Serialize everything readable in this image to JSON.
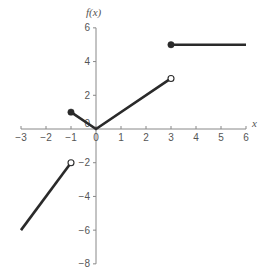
{
  "chart_data": {
    "type": "line",
    "title": "",
    "xlabel": "x",
    "ylabel": "f(x)",
    "xlim": [
      -3,
      6
    ],
    "ylim": [
      -8,
      6
    ],
    "grid": false,
    "x_ticks": [
      -3,
      -2,
      -1,
      0,
      1,
      2,
      3,
      4,
      5,
      6
    ],
    "x_tick_labels": [
      "−3",
      "−2",
      "−1",
      "0",
      "1",
      "2",
      "3",
      "4",
      "5",
      "6"
    ],
    "y_ticks": [
      -8,
      -6,
      -4,
      -2,
      0,
      2,
      4,
      6
    ],
    "y_tick_labels": [
      "−8",
      "−6",
      "−4",
      "−2",
      "0",
      "2",
      "4",
      "6"
    ],
    "series": [
      {
        "name": "piece-1",
        "x": [
          -3,
          -1
        ],
        "y": [
          -6,
          -2
        ],
        "endpoints": [
          {
            "x": -1,
            "y": -2,
            "style": "open"
          }
        ]
      },
      {
        "name": "piece-2",
        "x": [
          -1,
          0,
          3
        ],
        "y": [
          1,
          0,
          3
        ],
        "endpoints": [
          {
            "x": -1,
            "y": 1,
            "style": "closed"
          },
          {
            "x": 3,
            "y": 3,
            "style": "open"
          }
        ]
      },
      {
        "name": "piece-3",
        "x": [
          3,
          6
        ],
        "y": [
          5,
          5
        ],
        "endpoints": [
          {
            "x": 3,
            "y": 5,
            "style": "closed"
          }
        ]
      }
    ]
  },
  "labels": {
    "x_axis_title": "x",
    "y_axis_title": "f(x)"
  },
  "colors": {
    "line": "#2a2a2a",
    "axis": "#888888",
    "text": "#555555",
    "background": "#ffffff"
  }
}
